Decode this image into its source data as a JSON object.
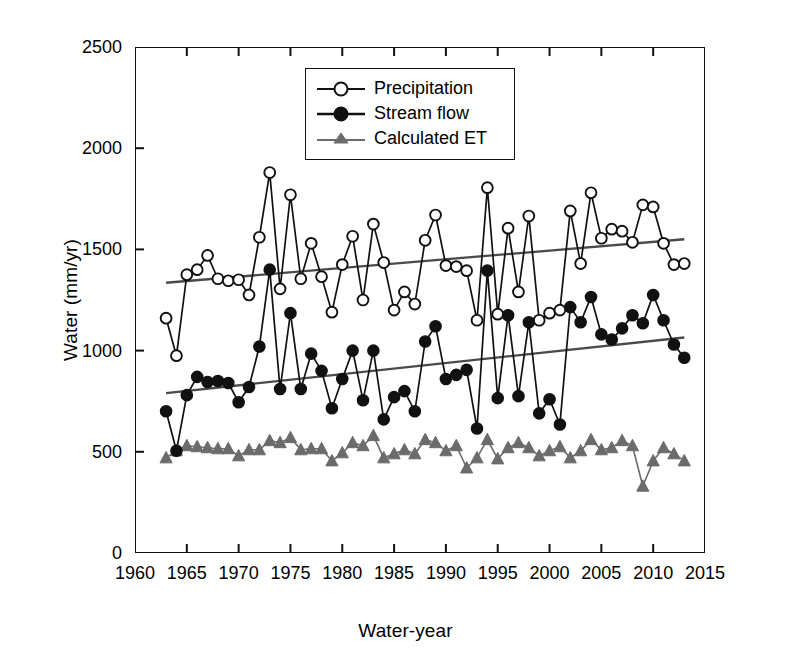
{
  "chart_data": {
    "type": "line",
    "title": "",
    "xlabel": "Water-year",
    "ylabel": "Water (mm/yr)",
    "xlim": [
      1960,
      2015
    ],
    "ylim": [
      0,
      2500
    ],
    "xticks": [
      1960,
      1965,
      1970,
      1975,
      1980,
      1985,
      1990,
      1995,
      2000,
      2005,
      2010,
      2015
    ],
    "yticks": [
      0,
      500,
      1000,
      1500,
      2000,
      2500
    ],
    "grid": false,
    "legend_position": "upper-center",
    "x": [
      1963,
      1964,
      1965,
      1966,
      1967,
      1968,
      1969,
      1970,
      1971,
      1972,
      1973,
      1974,
      1975,
      1976,
      1977,
      1978,
      1979,
      1980,
      1981,
      1982,
      1983,
      1984,
      1985,
      1986,
      1987,
      1988,
      1989,
      1990,
      1991,
      1992,
      1993,
      1994,
      1995,
      1996,
      1997,
      1998,
      1999,
      2000,
      2001,
      2002,
      2003,
      2004,
      2005,
      2006,
      2007,
      2008,
      2009,
      2010,
      2011,
      2012,
      2013
    ],
    "series": [
      {
        "name": "Precipitation",
        "marker": "open-circle",
        "color": "#111111",
        "values": [
          1160,
          975,
          1375,
          1400,
          1470,
          1355,
          1345,
          1350,
          1275,
          1560,
          1880,
          1305,
          1770,
          1355,
          1530,
          1365,
          1190,
          1425,
          1565,
          1250,
          1625,
          1435,
          1200,
          1290,
          1230,
          1545,
          1670,
          1420,
          1415,
          1395,
          1150,
          1805,
          1180,
          1605,
          1290,
          1665,
          1150,
          1185,
          1200,
          1690,
          1430,
          1780,
          1555,
          1600,
          1590,
          1535,
          1720,
          1710,
          1530,
          1425,
          1430
        ]
      },
      {
        "name": "Stream flow",
        "marker": "filled-circle",
        "color": "#111111",
        "values": [
          700,
          505,
          780,
          870,
          845,
          850,
          840,
          745,
          820,
          1020,
          1400,
          810,
          1185,
          810,
          985,
          900,
          715,
          860,
          1000,
          755,
          1000,
          660,
          770,
          800,
          700,
          1045,
          1120,
          860,
          880,
          905,
          615,
          1395,
          765,
          1175,
          775,
          1140,
          690,
          760,
          635,
          1215,
          1140,
          1265,
          1080,
          1055,
          1110,
          1175,
          1135,
          1275,
          1150,
          1030,
          965
        ]
      },
      {
        "name": "Calculated ET",
        "marker": "filled-triangle",
        "color": "#6b6b6b",
        "values": [
          470,
          505,
          530,
          525,
          520,
          515,
          515,
          480,
          510,
          510,
          555,
          545,
          570,
          510,
          515,
          515,
          455,
          495,
          545,
          530,
          580,
          470,
          490,
          510,
          490,
          560,
          545,
          505,
          530,
          420,
          470,
          560,
          465,
          520,
          545,
          520,
          480,
          505,
          525,
          470,
          505,
          560,
          510,
          520,
          555,
          530,
          330,
          455,
          520,
          490,
          455
        ]
      }
    ],
    "trend_lines": [
      {
        "name": "Precipitation trend",
        "x": [
          1963,
          2013
        ],
        "y": [
          1335,
          1550
        ],
        "color": "#4a4a4a"
      },
      {
        "name": "Stream flow trend",
        "x": [
          1963,
          2013
        ],
        "y": [
          790,
          1065
        ],
        "color": "#4a4a4a"
      }
    ]
  },
  "axes": {
    "y_title": "Water (mm/yr)",
    "x_title": "Water-year",
    "y_tick_labels": [
      "0",
      "500",
      "1000",
      "1500",
      "2000",
      "2500"
    ],
    "x_tick_labels": [
      "1960",
      "1965",
      "1970",
      "1975",
      "1980",
      "1985",
      "1990",
      "1995",
      "2000",
      "2005",
      "2010",
      "2015"
    ]
  },
  "legend": {
    "items": [
      {
        "label": "Precipitation",
        "marker": "open-circle"
      },
      {
        "label": "Stream flow",
        "marker": "filled-circle"
      },
      {
        "label": "Calculated ET",
        "marker": "filled-triangle"
      }
    ]
  }
}
